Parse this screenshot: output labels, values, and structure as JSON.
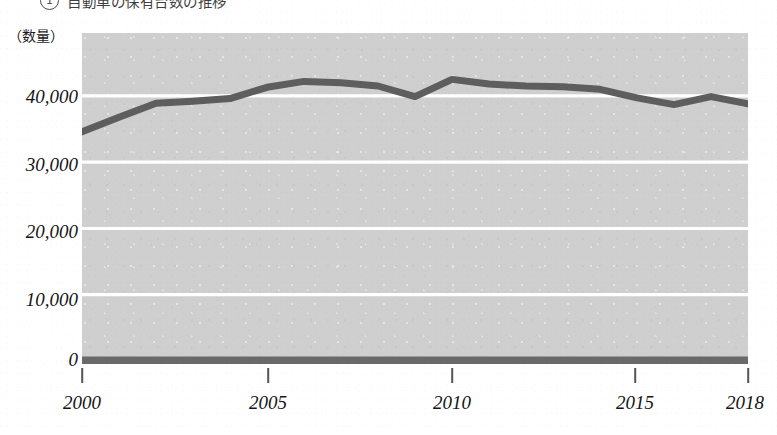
{
  "header": {
    "marker": "1",
    "clipped_caption": "自動車の保有台数の推移"
  },
  "chart_data": {
    "type": "line",
    "title": "",
    "subtitle": "",
    "xlabel": "",
    "ylabel": "（数量）",
    "unit_label": "（数量）",
    "x": [
      2000,
      2001,
      2002,
      2003,
      2004,
      2005,
      2006,
      2007,
      2008,
      2009,
      2010,
      2011,
      2012,
      2013,
      2014,
      2015,
      2016,
      2017,
      2018
    ],
    "series": [
      {
        "name": "数量",
        "color": "#5e5e5e",
        "values": [
          34600,
          36800,
          38900,
          39200,
          39600,
          41300,
          42200,
          42000,
          41500,
          39900,
          42500,
          41800,
          41500,
          41400,
          41000,
          39700,
          38700,
          39900,
          38800
        ]
      }
    ],
    "categories": [
      "2000",
      "2001",
      "2002",
      "2003",
      "2004",
      "2005",
      "2006",
      "2007",
      "2008",
      "2009",
      "2010",
      "2011",
      "2012",
      "2013",
      "2014",
      "2015",
      "2016",
      "2017",
      "2018"
    ],
    "x_tick_labels": [
      "2000",
      "2005",
      "2010",
      "2015",
      "2018"
    ],
    "x_tick_values": [
      2000,
      2005,
      2010,
      2015,
      2018
    ],
    "y_tick_labels": [
      "40,000",
      "30,000",
      "20,000",
      "10,000",
      "0"
    ],
    "y_tick_values": [
      40000,
      30000,
      20000,
      10000,
      0
    ],
    "ylim": [
      0,
      49500
    ],
    "xlim": [
      2000,
      2018
    ],
    "grid": true,
    "grid_color": "#ffffff",
    "legend": "none",
    "plot_background": "#cfcfcf",
    "baseline_color": "#6a6a6a"
  },
  "axis": {
    "y_ticks": [
      {
        "label": "40,000",
        "value": 40000
      },
      {
        "label": "30,000",
        "value": 30000
      },
      {
        "label": "20,000",
        "value": 20000
      },
      {
        "label": "10,000",
        "value": 10000
      },
      {
        "label": "0",
        "value": 0
      }
    ],
    "x_ticks": [
      {
        "label": "2000",
        "value": 2000
      },
      {
        "label": "2005",
        "value": 2005
      },
      {
        "label": "2010",
        "value": 2010
      },
      {
        "label": "2015",
        "value": 2015
      },
      {
        "label": "2018",
        "value": 2018
      }
    ]
  },
  "colors": {
    "line": "#5e5e5e",
    "plot_bg": "#cfcfcf",
    "gridline": "#ffffff",
    "text": "#141414",
    "baseline": "#6a6a6a"
  }
}
